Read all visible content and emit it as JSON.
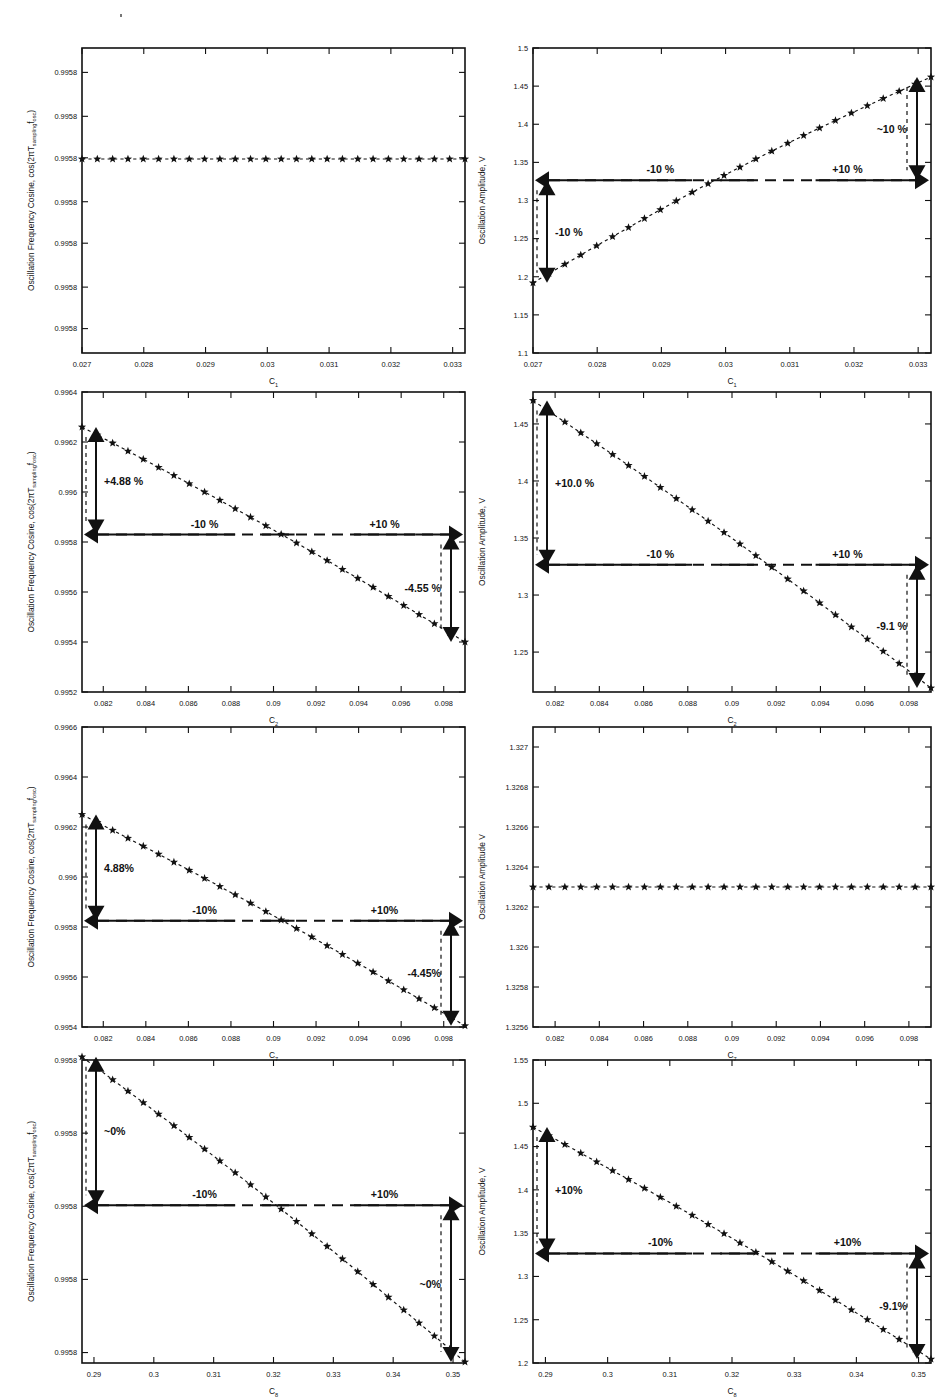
{
  "figure": {
    "speck_note": "scan-artifact-dot",
    "columns": [
      "Oscillation Frequency Cosine",
      "Oscillation Amplitude"
    ],
    "rows": [
      "C1",
      "C2",
      "C7",
      "C8"
    ]
  },
  "labels": {
    "ylabel_freq": "Oscillation Frequency Cosine, cos(2πT",
    "ylabel_freq_sub1": "sampling",
    "ylabel_freq_mid": "f",
    "ylabel_freq_sub2": "osc",
    "ylabel_freq_end": ")",
    "ylabel_amp": "Oscillation Amplitude, V",
    "ylabel_amp_plain": "Oscillation Amplitude V",
    "xlabel_c": "C",
    "x_sub_1": "1",
    "x_sub_2": "2",
    "x_sub_7": "7",
    "x_sub_8": "8"
  },
  "chart_data": [
    {
      "id": "p1",
      "type": "scatter",
      "title": "",
      "xlabel": "C1",
      "ylabel": "Oscillation Frequency Cosine, cos(2πT_sampling f_osc)",
      "xlim": [
        0.027,
        0.0332
      ],
      "ylim": [
        0.99575,
        0.995875
      ],
      "xticks": [
        0.027,
        0.028,
        0.029,
        0.03,
        0.031,
        0.032,
        0.033
      ],
      "xticklabels": [
        "0.027",
        "0.028",
        "0.029",
        "0.03",
        "0.031",
        "0.032",
        "0.033"
      ],
      "yticks": [
        0.99576,
        0.995777,
        0.995795,
        0.995812,
        0.99583,
        0.995847,
        0.995865
      ],
      "yticklabels": [
        "0.9958",
        "0.9958",
        "0.9958",
        "0.9958",
        "0.9958",
        "0.9958",
        "0.9958"
      ],
      "flat": true,
      "flat_value": 0.9958295,
      "n_points": 26,
      "annotations": [],
      "grid": false,
      "legend": null
    },
    {
      "id": "p2",
      "type": "scatter",
      "title": "",
      "xlabel": "C1",
      "ylabel": "Oscillation Amplitude, V",
      "xlim": [
        0.027,
        0.0332
      ],
      "ylim": [
        1.1,
        1.5
      ],
      "xticks": [
        0.027,
        0.028,
        0.029,
        0.03,
        0.031,
        0.032,
        0.033
      ],
      "xticklabels": [
        "0.027",
        "0.028",
        "0.029",
        "0.03",
        "0.031",
        "0.032",
        "0.033"
      ],
      "yticks": [
        1.1,
        1.15,
        1.2,
        1.25,
        1.3,
        1.35,
        1.4,
        1.45,
        1.5
      ],
      "yticklabels": [
        "1.1",
        "1.15",
        "1.2",
        "1.25",
        "1.3",
        "1.35",
        "1.4",
        "1.45",
        "1.5"
      ],
      "nominal": 1.3265,
      "y_start": 1.192,
      "y_end": 1.462,
      "n_points": 26,
      "slope_sign": "increasing",
      "annotations": [
        {
          "text": "-10 %",
          "role": "x-left-range"
        },
        {
          "text": "+10 %",
          "role": "x-right-range"
        },
        {
          "text": "-10 %",
          "role": "y-low-delta"
        },
        {
          "text": "~10 %",
          "role": "y-high-delta"
        }
      ],
      "grid": false,
      "legend": null
    },
    {
      "id": "p3",
      "type": "scatter",
      "title": "",
      "xlabel": "C2",
      "ylabel": "Oscillation Frequency Cosine, cos(2πT_sampling f_osc)",
      "xlim": [
        0.081,
        0.099
      ],
      "ylim": [
        0.9952,
        0.9964
      ],
      "xticks": [
        0.082,
        0.084,
        0.086,
        0.088,
        0.09,
        0.092,
        0.094,
        0.096,
        0.098
      ],
      "xticklabels": [
        "0.082",
        "0.084",
        "0.086",
        "0.088",
        "0.09",
        "0.092",
        "0.094",
        "0.096",
        "0.098"
      ],
      "yticks": [
        0.9952,
        0.9954,
        0.9956,
        0.9958,
        0.996,
        0.9962,
        0.9964
      ],
      "yticklabels": [
        "0.9952",
        "0.9954",
        "0.9956",
        "0.9958",
        "0.996",
        "0.9962",
        "0.9964"
      ],
      "nominal": 0.99583,
      "y_start": 0.99626,
      "y_end": 0.9954,
      "n_points": 26,
      "slope_sign": "decreasing",
      "annotations": [
        {
          "text": "+4.88 %",
          "role": "y-high-delta"
        },
        {
          "text": "-4.55 %",
          "role": "y-low-delta"
        },
        {
          "text": "-10 %",
          "role": "x-left-range"
        },
        {
          "text": "+10 %",
          "role": "x-right-range"
        }
      ],
      "grid": false,
      "legend": null
    },
    {
      "id": "p4",
      "type": "scatter",
      "title": "",
      "xlabel": "C2",
      "ylabel": "Oscillation Amplitude, V",
      "xlim": [
        0.081,
        0.099
      ],
      "ylim": [
        1.215,
        1.478
      ],
      "xticks": [
        0.082,
        0.084,
        0.086,
        0.088,
        0.09,
        0.092,
        0.094,
        0.096,
        0.098
      ],
      "xticklabels": [
        "0.082",
        "0.084",
        "0.086",
        "0.088",
        "0.09",
        "0.092",
        "0.094",
        "0.096",
        "0.098"
      ],
      "yticks": [
        1.25,
        1.3,
        1.35,
        1.4,
        1.45
      ],
      "yticklabels": [
        "1.25",
        "1.3",
        "1.35",
        "1.4",
        "1.45"
      ],
      "nominal": 1.3265,
      "y_start": 1.4705,
      "y_end": 1.2185,
      "n_points": 26,
      "slope_sign": "decreasing",
      "annotations": [
        {
          "text": "+10.0 %",
          "role": "y-high-delta"
        },
        {
          "text": "-9.1 %",
          "role": "y-low-delta"
        },
        {
          "text": "-10 %",
          "role": "x-left-range"
        },
        {
          "text": "+10 %",
          "role": "x-right-range"
        }
      ],
      "grid": false,
      "legend": null
    },
    {
      "id": "p5",
      "type": "scatter",
      "title": "",
      "xlabel": "C7",
      "ylabel": "Oscillation Frequency Cosine, cos(2πT_sampling f_osc)",
      "xlim": [
        0.081,
        0.099
      ],
      "ylim": [
        0.9954,
        0.9966
      ],
      "xticks": [
        0.082,
        0.084,
        0.086,
        0.088,
        0.09,
        0.092,
        0.094,
        0.096,
        0.098
      ],
      "xticklabels": [
        "0.082",
        "0.084",
        "0.086",
        "0.088",
        "0.09",
        "0.092",
        "0.094",
        "0.096",
        "0.098"
      ],
      "yticks": [
        0.9954,
        0.9956,
        0.9958,
        0.996,
        0.9962,
        0.9964,
        0.9966
      ],
      "yticklabels": [
        "0.9954",
        "0.9956",
        "0.9958",
        "0.996",
        "0.9962",
        "0.9964",
        "0.9966"
      ],
      "nominal": 0.995825,
      "y_start": 0.99625,
      "y_end": 0.995405,
      "n_points": 26,
      "slope_sign": "decreasing",
      "annotations": [
        {
          "text": "4.88%",
          "role": "y-high-delta"
        },
        {
          "text": "-4.45%",
          "role": "y-low-delta"
        },
        {
          "text": "-10%",
          "role": "x-left-range"
        },
        {
          "text": "+10%",
          "role": "x-right-range"
        }
      ],
      "grid": false,
      "legend": null
    },
    {
      "id": "p6",
      "type": "scatter",
      "title": "",
      "xlabel": "C7",
      "ylabel": "Oscillation Amplitude V",
      "xlim": [
        0.081,
        0.099
      ],
      "ylim": [
        1.3256,
        1.3271
      ],
      "xticks": [
        0.082,
        0.084,
        0.086,
        0.088,
        0.09,
        0.092,
        0.094,
        0.096,
        0.098
      ],
      "xticklabels": [
        "0.082",
        "0.084",
        "0.086",
        "0.088",
        "0.09",
        "0.092",
        "0.094",
        "0.096",
        "0.098"
      ],
      "yticks": [
        1.3256,
        1.3258,
        1.326,
        1.3262,
        1.3264,
        1.3266,
        1.3268,
        1.327
      ],
      "yticklabels": [
        "1.3256",
        "1.3258",
        "1.326",
        "1.3262",
        "1.3264",
        "1.3266",
        "1.3268",
        "1.327"
      ],
      "flat": true,
      "flat_value": 1.3263,
      "n_points": 26,
      "annotations": [],
      "grid": false,
      "legend": null
    },
    {
      "id": "p7",
      "type": "scatter",
      "title": "",
      "xlabel": "C8",
      "ylabel": "Oscillation Frequency Cosine, cos(2πT_sampling f_osc)",
      "xlim": [
        0.288,
        0.352
      ],
      "ylim": [
        0.99574,
        0.995885
      ],
      "xticks": [
        0.29,
        0.3,
        0.31,
        0.32,
        0.33,
        0.34,
        0.35
      ],
      "xticklabels": [
        "0.29",
        "0.3",
        "0.31",
        "0.32",
        "0.33",
        "0.34",
        "0.35"
      ],
      "yticks": [
        0.995745,
        0.99578,
        0.995815,
        0.99585,
        0.995885
      ],
      "yticklabels": [
        "0.9958",
        "0.9958",
        "0.9958",
        "0.9958",
        "0.9958"
      ],
      "nominal": 0.9958155,
      "y_start": 0.9958865,
      "y_end": 0.9957405,
      "n_points": 26,
      "slope_sign": "decreasing",
      "annotations": [
        {
          "text": "~0%",
          "role": "y-high-delta"
        },
        {
          "text": "~0%",
          "role": "y-low-delta"
        },
        {
          "text": "-10%",
          "role": "x-left-range"
        },
        {
          "text": "+10%",
          "role": "x-right-range"
        }
      ],
      "grid": false,
      "legend": null
    },
    {
      "id": "p8",
      "type": "scatter",
      "title": "",
      "xlabel": "C8",
      "ylabel": "Oscillation Amplitude, V",
      "xlim": [
        0.288,
        0.352
      ],
      "ylim": [
        1.2,
        1.55
      ],
      "xticks": [
        0.29,
        0.3,
        0.31,
        0.32,
        0.33,
        0.34,
        0.35
      ],
      "xticklabels": [
        "0.29",
        "0.3",
        "0.31",
        "0.32",
        "0.33",
        "0.34",
        "0.35"
      ],
      "yticks": [
        1.2,
        1.25,
        1.3,
        1.35,
        1.4,
        1.45,
        1.5,
        1.55
      ],
      "yticklabels": [
        "1.2",
        "1.25",
        "1.3",
        "1.35",
        "1.4",
        "1.45",
        "1.5",
        "1.55"
      ],
      "nominal": 1.3265,
      "y_start": 1.4725,
      "y_end": 1.2045,
      "n_points": 26,
      "slope_sign": "decreasing",
      "annotations": [
        {
          "text": "+10%",
          "role": "y-high-delta"
        },
        {
          "text": "-9.1%",
          "role": "y-low-delta"
        },
        {
          "text": "-10%",
          "role": "x-left-range"
        },
        {
          "text": "+10%",
          "role": "x-right-range"
        }
      ],
      "grid": false,
      "legend": null
    }
  ]
}
